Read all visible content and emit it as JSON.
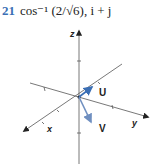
{
  "problem": {
    "number": "21",
    "answer_text": "cos⁻¹ (2/√6), i + j"
  },
  "diagram": {
    "axes": {
      "x": "x",
      "y": "y",
      "z": "z"
    },
    "vectors": [
      {
        "label": "U",
        "color": "#3b6fb5"
      },
      {
        "label": "V",
        "color": "#6f8fc0"
      }
    ],
    "axis_color": "#555555"
  }
}
